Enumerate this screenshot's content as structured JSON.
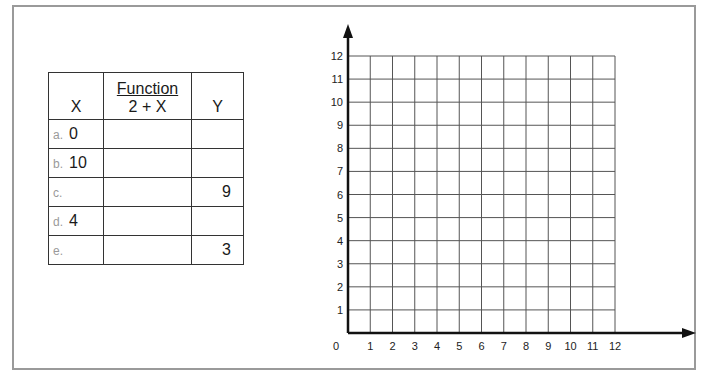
{
  "table": {
    "headers": {
      "x": "X",
      "function_title": "Function",
      "function_expr": "2 + X",
      "y": "Y"
    },
    "rows": [
      {
        "label": "a.",
        "x": "0",
        "fx": "",
        "y": ""
      },
      {
        "label": "b.",
        "x": "10",
        "fx": "",
        "y": ""
      },
      {
        "label": "c.",
        "x": "",
        "fx": "",
        "y": "9"
      },
      {
        "label": "d.",
        "x": "4",
        "fx": "",
        "y": ""
      },
      {
        "label": "e.",
        "x": "",
        "fx": "",
        "y": "3"
      }
    ]
  },
  "graph": {
    "origin_label": "0",
    "x_ticks": [
      "1",
      "2",
      "3",
      "4",
      "5",
      "6",
      "7",
      "8",
      "9",
      "10",
      "11",
      "12"
    ],
    "y_ticks": [
      "1",
      "2",
      "3",
      "4",
      "5",
      "6",
      "7",
      "8",
      "9",
      "10",
      "11",
      "12"
    ],
    "x_range": [
      0,
      12
    ],
    "y_range": [
      0,
      12
    ],
    "grid": true,
    "colors": {
      "grid": "#555555",
      "axis": "#111111",
      "frame": "#9a9a9a"
    }
  }
}
